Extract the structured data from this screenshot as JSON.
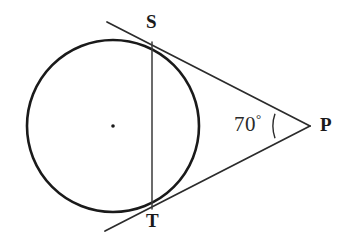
{
  "figure": {
    "type": "geometry-diagram",
    "background_color": "#ffffff",
    "stroke_color": "#1a1a1a",
    "labels": {
      "point_s": "S",
      "point_t": "T",
      "point_p": "P",
      "angle_p_value": "70",
      "angle_p_degree_symbol": "°"
    },
    "geometry": {
      "circle": {
        "center_x": 113,
        "center_y": 126,
        "radius": 86,
        "stroke_width": 2.6,
        "center_dot_radius": 1.8
      },
      "tangent_point_s": {
        "x": 152,
        "y": 42
      },
      "tangent_point_t": {
        "x": 152,
        "y": 209
      },
      "external_point_p": {
        "x": 310,
        "y": 126
      },
      "tangent_upper_far_end": {
        "x": 107,
        "y": 22
      },
      "tangent_lower_far_end": {
        "x": 105,
        "y": 231
      },
      "chord_st": {
        "x1": 152,
        "y1": 42,
        "x2": 152,
        "y2": 209
      },
      "angle_arc": {
        "center_x": 310,
        "center_y": 126,
        "radius": 37,
        "start_x": 275.0,
        "start_y": 113.8,
        "end_x": 275.0,
        "end_y": 138.2
      }
    }
  }
}
